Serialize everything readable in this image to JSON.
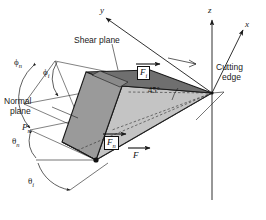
{
  "figure": {
    "axes": [
      {
        "name": "y",
        "label": "y"
      },
      {
        "name": "z",
        "label": "z"
      },
      {
        "name": "x",
        "label": "x"
      }
    ],
    "callouts": {
      "shear_plane": "Shear plane",
      "normal_plane_line1": "Normal",
      "normal_plane_line2": "plane",
      "normal_plane_symbol": "P",
      "normal_plane_symbol_sub": "n",
      "cutting_edge_line1": "Cutting",
      "cutting_edge_line2": "edge"
    },
    "angles": [
      {
        "name": "phi-n",
        "symbol": "ϕ",
        "sub": "n"
      },
      {
        "name": "phi-i",
        "symbol": "ϕ",
        "sub": "i"
      },
      {
        "name": "theta-n",
        "symbol": "θ",
        "sub": "n"
      },
      {
        "name": "theta-i",
        "symbol": "θ",
        "sub": "i"
      },
      {
        "name": "forty-five",
        "symbol": "45°",
        "sub": ""
      }
    ],
    "forces": [
      {
        "name": "F-i",
        "symbol": "F",
        "sub": "i",
        "boxed": true
      },
      {
        "name": "F-n",
        "symbol": "F",
        "sub": "n",
        "boxed": true
      },
      {
        "name": "F",
        "symbol": "F",
        "sub": "",
        "boxed": false
      }
    ],
    "colors": {
      "line": "#1a1a1a",
      "face_top_dark": "#6f6f6f",
      "face_left_mid": "#9a9a9a",
      "face_right_light": "#c4c4c4",
      "face_front_light": "#b0b0b0",
      "background": "#ffffff"
    }
  }
}
